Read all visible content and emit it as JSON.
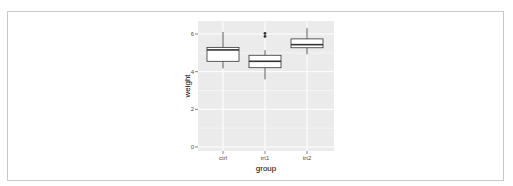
{
  "chart_data": {
    "type": "box",
    "title": "",
    "xlabel": "group",
    "ylabel": "weight",
    "categories": [
      "ctrl",
      "trt1",
      "trt2"
    ],
    "ylim": [
      0,
      6.5
    ],
    "yticks": [
      0,
      2,
      4,
      6
    ],
    "grid": true,
    "legend": null,
    "series": [
      {
        "name": "ctrl",
        "whisker_low": 4.17,
        "q1": 4.55,
        "median": 5.155,
        "q3": 5.29,
        "whisker_high": 6.11,
        "outliers": []
      },
      {
        "name": "trt1",
        "whisker_low": 3.59,
        "q1": 4.21,
        "median": 4.55,
        "q3": 4.87,
        "whisker_high": 5.14,
        "outliers": [
          5.87,
          6.03
        ]
      },
      {
        "name": "trt2",
        "whisker_low": 4.92,
        "q1": 5.27,
        "median": 5.435,
        "q3": 5.74,
        "whisker_high": 6.31,
        "outliers": []
      }
    ]
  },
  "axes": {
    "x_title": "group",
    "y_title": "weight",
    "x_ticks": [
      "ctrl",
      "trt1",
      "trt2"
    ],
    "y_ticks": [
      "0",
      "2",
      "4",
      "6"
    ]
  },
  "colors": {
    "panel": "#EBEBEB",
    "grid": "#FFFFFF",
    "box_fill": "#FFFFFF",
    "box_line": "#333333",
    "tick_text": "#4D4D4D",
    "frame": "#C8C8C8"
  }
}
